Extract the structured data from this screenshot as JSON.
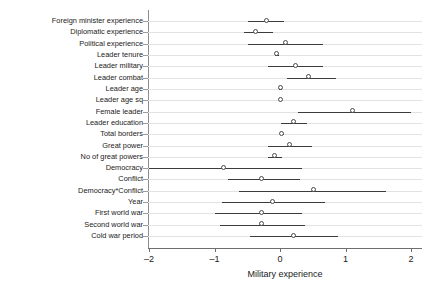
{
  "chart_data": {
    "type": "scatter",
    "title": "",
    "xlabel": "Military experience",
    "ylabel": "",
    "xlim": [
      -2.2,
      2.2
    ],
    "xticks": [
      -2,
      -1,
      0,
      1,
      2
    ],
    "xticklabels": [
      "–2",
      "–1",
      "0",
      "1",
      "2"
    ],
    "grid": true,
    "grid_axis": "y",
    "reference_line": 0,
    "marker": "open-circle",
    "categories": [
      "Foreign minister experience",
      "Diplomatic experience",
      "Political experience",
      "Leader tenure",
      "Leader military",
      "Leader combat",
      "Leader age",
      "Leader age sq",
      "Female leader",
      "Leader education",
      "Total borders",
      "Great power",
      "No of great powers",
      "Democracy",
      "Conflict",
      "Democracy*Conflict",
      "Year",
      "First world war",
      "Second world war",
      "Cold war period"
    ],
    "estimates": [
      -0.21,
      -0.37,
      0.08,
      -0.05,
      0.23,
      0.43,
      0.01,
      0.0,
      1.1,
      0.2,
      0.03,
      0.15,
      -0.09,
      -0.86,
      -0.28,
      0.51,
      -0.12,
      -0.29,
      -0.29,
      0.2
    ],
    "ci_low": [
      -0.49,
      -0.55,
      -0.49,
      -0.08,
      -0.18,
      0.11,
      -0.01,
      -0.02,
      0.28,
      0.02,
      0.0,
      -0.18,
      -0.18,
      -2.0,
      -0.8,
      -0.63,
      -0.88,
      -1.0,
      -0.91,
      -0.46
    ],
    "ci_high": [
      0.06,
      -0.11,
      0.66,
      -0.02,
      0.66,
      0.85,
      0.03,
      0.02,
      2.0,
      0.42,
      0.06,
      0.49,
      0.03,
      0.34,
      0.31,
      1.62,
      0.69,
      0.34,
      0.38,
      0.88
    ]
  },
  "axis": {
    "x_title": "Military experience",
    "x_tick_labels": [
      "–2",
      "–1",
      "0",
      "1",
      "2"
    ]
  },
  "rows": [
    {
      "label": "Foreign minister experience"
    },
    {
      "label": "Diplomatic experience"
    },
    {
      "label": "Political experience"
    },
    {
      "label": "Leader tenure"
    },
    {
      "label": "Leader military"
    },
    {
      "label": "Leader combat"
    },
    {
      "label": "Leader age"
    },
    {
      "label": "Leader age sq"
    },
    {
      "label": "Female leader"
    },
    {
      "label": "Leader education"
    },
    {
      "label": "Total borders"
    },
    {
      "label": "Great power"
    },
    {
      "label": "No of great powers"
    },
    {
      "label": "Democracy"
    },
    {
      "label": "Conflict"
    },
    {
      "label": "Democracy*Conflict"
    },
    {
      "label": "Year"
    },
    {
      "label": "First world war"
    },
    {
      "label": "Second world war"
    },
    {
      "label": "Cold war period"
    }
  ],
  "style": {
    "marker_edge_color": "#4a4a4a",
    "marker_face_color": "#ffffff",
    "ci_color": "#3c3c3c",
    "grid_color": "#e2e2e2",
    "zero_line_color": "#8c8c8c",
    "axis_color": "#6f6f6f",
    "background": "#ffffff"
  }
}
